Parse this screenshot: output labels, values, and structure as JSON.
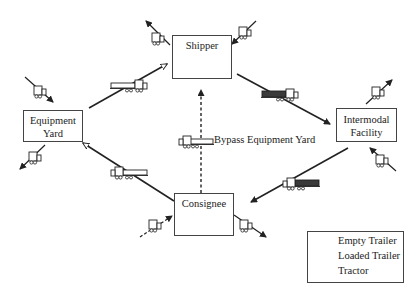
{
  "nodes": {
    "shipper": {
      "label": "Shipper"
    },
    "equipment_yard": {
      "line1": "Equipment",
      "line2": "Yard"
    },
    "intermodal": {
      "line1": "Intermodal",
      "line2": "Facility"
    },
    "consignee": {
      "label": "Consignee"
    }
  },
  "edges": {
    "bypass_label": "Bypass Equipment Yard"
  },
  "legend": {
    "items": [
      {
        "icon": "empty-trailer-icon",
        "label": "Empty Trailer"
      },
      {
        "icon": "loaded-trailer-icon",
        "label": "Loaded Trailer"
      },
      {
        "icon": "tractor-icon",
        "label": "Tractor"
      }
    ]
  },
  "colors": {
    "line": "#222222",
    "loaded_fill": "#3a3a3a",
    "box_border": "#444444"
  }
}
